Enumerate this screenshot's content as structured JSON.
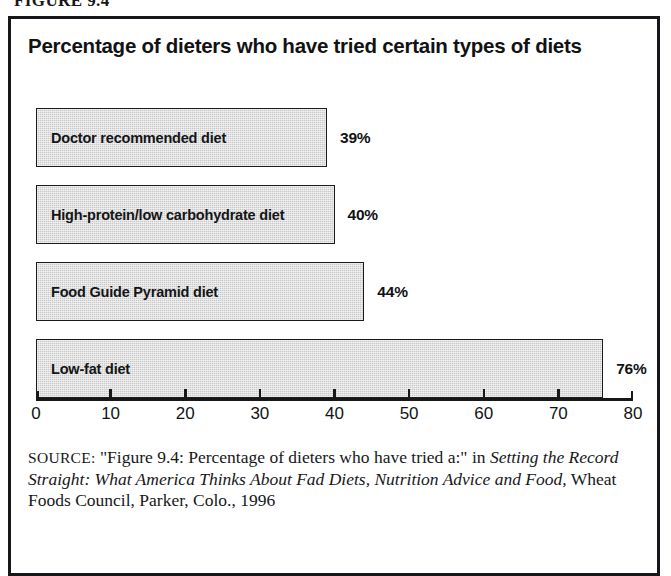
{
  "figure_caption": "FIGURE 9.4",
  "chart": {
    "title": "Percentage of dieters who have tried certain types of diets"
  },
  "source": {
    "label": "SOURCE:",
    "quoted_title": "\"Figure 9.4: Percentage of dieters who have tried a:\" in",
    "publication_italic": "Setting the Record Straight: What America Thinks About Fad Diets, Nutrition Advice and Food,",
    "publisher": "Wheat Foods Council, Parker, Colo.,",
    "year": "1996"
  },
  "chart_data": {
    "type": "bar",
    "orientation": "horizontal",
    "title": "Percentage of dieters who have tried certain types of diets",
    "xlabel": "",
    "ylabel": "",
    "xlim": [
      0,
      80
    ],
    "xticks": [
      0,
      10,
      20,
      30,
      40,
      50,
      60,
      70,
      80
    ],
    "xtick_labels": [
      "0",
      "10",
      "20",
      "30",
      "40",
      "50",
      "60",
      "70",
      "80"
    ],
    "grid": false,
    "legend": false,
    "bar_fill_color": "#c9c9c9",
    "bar_border_color": "#1a1b1d",
    "categories": [
      "Doctor recommended diet",
      "High-protein/low carbohydrate diet",
      "Food Guide Pyramid diet",
      "Low-fat diet"
    ],
    "values": [
      39,
      40,
      44,
      76
    ],
    "value_labels": [
      "39%",
      "40%",
      "44%",
      "76%"
    ],
    "bars": [
      {
        "label": "Doctor recommended diet",
        "value": 39,
        "value_label": "39%"
      },
      {
        "label": "High-protein/low carbohydrate diet",
        "value": 40,
        "value_label": "40%"
      },
      {
        "label": "Food Guide Pyramid diet",
        "value": 44,
        "value_label": "44%"
      },
      {
        "label": "Low-fat diet",
        "value": 76,
        "value_label": "76%"
      }
    ]
  }
}
